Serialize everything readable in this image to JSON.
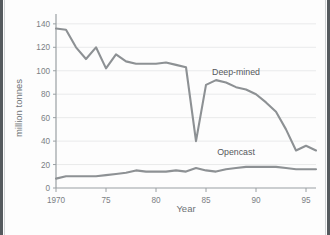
{
  "figure": {
    "background_color": "#fdfdfd",
    "border_color": "#555a5e",
    "axis_color": "#9aa0a3",
    "grid_color": "#e9eaeb",
    "line_color": "#8d9194",
    "text_color": "#7b8084"
  },
  "chart_data": {
    "type": "line",
    "title": "",
    "xlabel": "Year",
    "ylabel": "million tonnes",
    "xlim": [
      1970,
      1996
    ],
    "ylim": [
      0,
      145
    ],
    "yticks": [
      0,
      20,
      40,
      60,
      80,
      100,
      120,
      140
    ],
    "ytick_labels": [
      "0",
      "20",
      "40",
      "60",
      "80",
      "100",
      "120",
      "140"
    ],
    "xticks": [
      1970,
      1975,
      1980,
      1985,
      1990,
      1995
    ],
    "xtick_labels": [
      "1970",
      "75",
      "80",
      "85",
      "90",
      "95"
    ],
    "grid": "horizontal",
    "legend_position": "inline-annotations",
    "x": [
      1970,
      1971,
      1972,
      1973,
      1974,
      1975,
      1976,
      1977,
      1978,
      1979,
      1980,
      1981,
      1982,
      1983,
      1984,
      1985,
      1986,
      1987,
      1988,
      1989,
      1990,
      1991,
      1992,
      1993,
      1994,
      1995,
      1996
    ],
    "series": [
      {
        "name": "Deep-mined",
        "label_x": 1988,
        "label_y": 96,
        "values": [
          136,
          135,
          120,
          110,
          120,
          102,
          114,
          108,
          106,
          106,
          106,
          107,
          105,
          103,
          40,
          88,
          92,
          90,
          86,
          84,
          80,
          73,
          65,
          50,
          32,
          36,
          32
        ]
      },
      {
        "name": "Opencast",
        "label_x": 1988,
        "label_y": 28,
        "values": [
          8,
          10,
          10,
          10,
          10,
          11,
          12,
          13,
          15,
          14,
          14,
          14,
          15,
          14,
          17,
          15,
          14,
          16,
          17,
          18,
          18,
          18,
          18,
          17,
          16,
          16,
          16
        ]
      }
    ],
    "annotations": [
      {
        "text": "Deep-mined",
        "x": 1988,
        "y": 96
      },
      {
        "text": "Opencast",
        "x": 1988,
        "y": 28
      }
    ]
  },
  "axes": {
    "y_title": "million tonnes",
    "x_title": "Year"
  }
}
